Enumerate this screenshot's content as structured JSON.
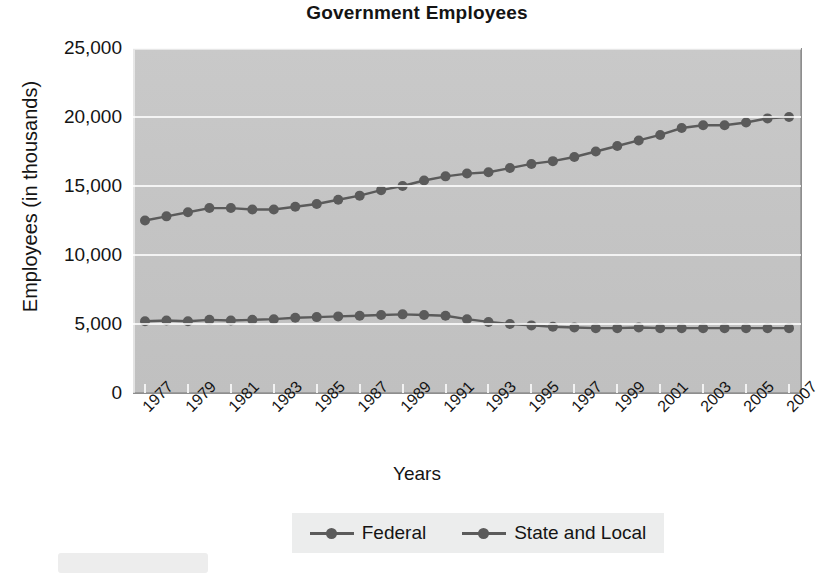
{
  "chart_data": {
    "type": "line",
    "title": "Government Employees",
    "xlabel": "Years",
    "ylabel": "Employees (in thousands)",
    "ylim": [
      0,
      25000
    ],
    "yticks": [
      "0",
      "5,000",
      "10,000",
      "15,000",
      "20,000",
      "25,000"
    ],
    "ytick_values": [
      0,
      5000,
      10000,
      15000,
      20000,
      25000
    ],
    "grid": true,
    "legend_position": "bottom",
    "x": [
      1977,
      1978,
      1979,
      1980,
      1981,
      1982,
      1983,
      1984,
      1985,
      1986,
      1987,
      1988,
      1989,
      1990,
      1991,
      1992,
      1993,
      1994,
      1995,
      1996,
      1997,
      1998,
      1999,
      2000,
      2001,
      2002,
      2003,
      2004,
      2005,
      2006,
      2007
    ],
    "xtick_labels": [
      "1977",
      "1979",
      "1981",
      "1983",
      "1985",
      "1987",
      "1989",
      "1991",
      "1993",
      "1995",
      "1997",
      "1999",
      "2001",
      "2003",
      "2005",
      "2007"
    ],
    "series": [
      {
        "name": "Federal",
        "color": "#5b5b5b",
        "values": [
          5200,
          5250,
          5200,
          5300,
          5250,
          5300,
          5350,
          5450,
          5500,
          5550,
          5600,
          5650,
          5700,
          5650,
          5600,
          5350,
          5150,
          5000,
          4900,
          4800,
          4750,
          4700,
          4700,
          4750,
          4700,
          4700,
          4700,
          4700,
          4700,
          4700,
          4700
        ]
      },
      {
        "name": "State and Local",
        "color": "#5b5b5b",
        "values": [
          12500,
          12800,
          13100,
          13400,
          13400,
          13300,
          13300,
          13500,
          13700,
          14000,
          14300,
          14700,
          15000,
          15400,
          15700,
          15900,
          16000,
          16300,
          16600,
          16800,
          17100,
          17500,
          17900,
          18300,
          18700,
          19200,
          19400,
          19400,
          19600,
          19900,
          20000
        ]
      }
    ]
  },
  "legend": {
    "items": [
      {
        "label": "Federal"
      },
      {
        "label": "State and Local"
      }
    ]
  }
}
